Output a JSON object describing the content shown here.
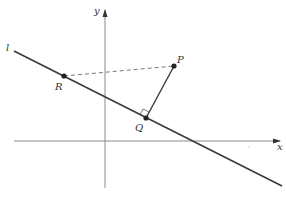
{
  "diagram": {
    "type": "coordinate-geometry",
    "colors": {
      "background": "#ffffff",
      "axis": "#8a8a8a",
      "line": "#3a3a3a",
      "dashed": "#6a6a6a",
      "point": "#222222",
      "label": "#333333"
    },
    "axes": {
      "x_label": "x",
      "y_label": "y"
    },
    "line_label": "l",
    "points": [
      {
        "id": "P",
        "label": "P"
      },
      {
        "id": "Q",
        "label": "Q"
      },
      {
        "id": "R",
        "label": "R"
      }
    ],
    "segments": [
      {
        "from": "P",
        "to": "Q",
        "style": "solid",
        "note": "perpendicular to l"
      },
      {
        "from": "R",
        "to": "P",
        "style": "dashed"
      }
    ],
    "right_angle_marker_at": "Q"
  }
}
